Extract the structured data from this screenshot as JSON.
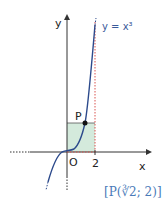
{
  "diagram": {
    "curve_label": "y = x³",
    "axis_x_label": "x",
    "axis_y_label": "y",
    "origin_label": "O",
    "tick_x_label": "2",
    "point_label": "P",
    "caption": "[P(∛2; 2)]",
    "colors": {
      "curve": "#2c4a8c",
      "axes": "#333333",
      "dotted_vertical": "#d9534f",
      "shaded_region": "#d4eadc",
      "caption": "#4a7ab8"
    }
  }
}
